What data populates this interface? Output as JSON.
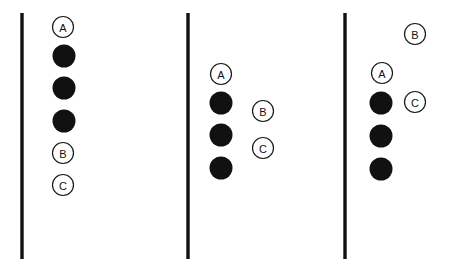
{
  "canvas": {
    "width": 449,
    "height": 276,
    "background": "#ffffff"
  },
  "style": {
    "line_color": "#111111",
    "line_width": 3.4,
    "filled_dot_color": "#111111",
    "outline_stroke_color": "#1a1a1a",
    "outline_fill_color": "#ffffff",
    "outline_stroke_width": 1.2,
    "label_color": "#111111",
    "filled_dot_radius": 11.5,
    "outline_radius": 10.5,
    "label_font_size": 11
  },
  "panels": [
    {
      "id": "panel-1",
      "name": "left-panel",
      "line": {
        "x": 22,
        "y1": 13,
        "y2": 259
      },
      "markers": [
        {
          "id": "p1-a",
          "label": "A",
          "kind": "outline",
          "cx": 63,
          "cy": 27
        },
        {
          "id": "p1-dot-1",
          "label": "",
          "kind": "filled",
          "cx": 64,
          "cy": 56
        },
        {
          "id": "p1-dot-2",
          "label": "",
          "kind": "filled",
          "cx": 64,
          "cy": 88
        },
        {
          "id": "p1-dot-3",
          "label": "",
          "kind": "filled",
          "cx": 64,
          "cy": 121
        },
        {
          "id": "p1-b",
          "label": "B",
          "kind": "outline",
          "cx": 63,
          "cy": 153
        },
        {
          "id": "p1-c",
          "label": "C",
          "kind": "outline",
          "cx": 63,
          "cy": 185
        }
      ]
    },
    {
      "id": "panel-2",
      "name": "middle-panel",
      "line": {
        "x": 188,
        "y1": 13,
        "y2": 259
      },
      "markers": [
        {
          "id": "p2-a",
          "label": "A",
          "kind": "outline",
          "cx": 221,
          "cy": 74
        },
        {
          "id": "p2-dot-1",
          "label": "",
          "kind": "filled",
          "cx": 221,
          "cy": 103
        },
        {
          "id": "p2-dot-2",
          "label": "",
          "kind": "filled",
          "cx": 221,
          "cy": 135
        },
        {
          "id": "p2-dot-3",
          "label": "",
          "kind": "filled",
          "cx": 221,
          "cy": 168
        },
        {
          "id": "p2-b",
          "label": "B",
          "kind": "outline",
          "cx": 263,
          "cy": 111
        },
        {
          "id": "p2-c",
          "label": "C",
          "kind": "outline",
          "cx": 263,
          "cy": 148
        }
      ]
    },
    {
      "id": "panel-3",
      "name": "right-panel",
      "line": {
        "x": 345,
        "y1": 13,
        "y2": 259
      },
      "markers": [
        {
          "id": "p3-b",
          "label": "B",
          "kind": "outline",
          "cx": 415,
          "cy": 34
        },
        {
          "id": "p3-a",
          "label": "A",
          "kind": "outline",
          "cx": 382,
          "cy": 73
        },
        {
          "id": "p3-c",
          "label": "C",
          "kind": "outline",
          "cx": 415,
          "cy": 102
        },
        {
          "id": "p3-dot-1",
          "label": "",
          "kind": "filled",
          "cx": 381,
          "cy": 103
        },
        {
          "id": "p3-dot-2",
          "label": "",
          "kind": "filled",
          "cx": 381,
          "cy": 136
        },
        {
          "id": "p3-dot-3",
          "label": "",
          "kind": "filled",
          "cx": 381,
          "cy": 169
        }
      ]
    }
  ]
}
